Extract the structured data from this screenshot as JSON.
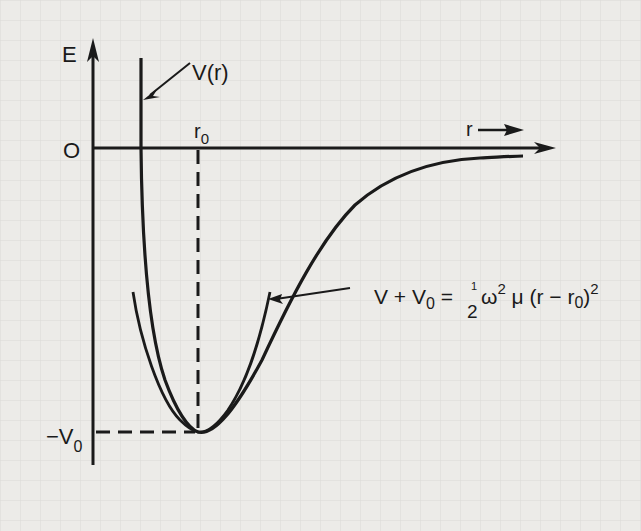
{
  "diagram": {
    "type": "potential-energy-curve",
    "axes": {
      "y_label": "E",
      "x_label": "r",
      "origin_label": "O"
    },
    "markers": {
      "r0_label": "r",
      "r0_sub": "0",
      "minus_v0_label": "−V",
      "minus_v0_sub": "0"
    },
    "curves": [
      {
        "name": "V(r)",
        "label": "V(r)",
        "description": "Molecular potential well (Morse-like)"
      },
      {
        "name": "harmonic-approximation",
        "label": "V + V0 = 1/2 ω² μ (r − r0)²",
        "description": "Parabolic approximation near minimum"
      }
    ],
    "equation": {
      "lhs_v": "V + V",
      "lhs_sub": "0",
      "eq": " = ",
      "frac_num": "1",
      "frac_den": "2",
      "omega": "ω",
      "omega_sup": "2",
      "mu": " μ (r − r",
      "r0_sub": "0",
      "close": ")",
      "close_sup": "2"
    },
    "colors": {
      "background": "#ecebe8",
      "grid": "#d6d5d1",
      "ink": "#1a1a1a"
    }
  }
}
